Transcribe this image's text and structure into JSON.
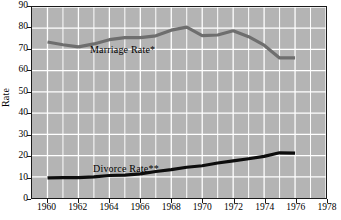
{
  "chart_data": {
    "type": "line",
    "title": "",
    "xlabel": "",
    "ylabel": "Rate",
    "xlim": [
      1959,
      1978
    ],
    "ylim": [
      0,
      90
    ],
    "yticks": [
      0,
      10,
      20,
      30,
      40,
      50,
      60,
      70,
      80,
      90
    ],
    "xticks": [
      1960,
      1962,
      1964,
      1966,
      1968,
      1970,
      1972,
      1974,
      1976,
      1978
    ],
    "grid": true,
    "grid_color": "#ffffff",
    "plot_background": "#b4b4b4",
    "legend_position": "inline-annotation",
    "series": [
      {
        "name": "Marriage Rate*",
        "color": "#6e6e6e",
        "x": [
          1960,
          1961,
          1962,
          1963,
          1964,
          1965,
          1966,
          1967,
          1968,
          1969,
          1970,
          1971,
          1972,
          1973,
          1974,
          1975,
          1976
        ],
        "values": [
          73.5,
          72.2,
          71.2,
          72.6,
          74.6,
          75.6,
          75.6,
          76.4,
          79.1,
          80.5,
          76.5,
          76.8,
          78.8,
          76.0,
          72.0,
          66.0,
          66.0
        ]
      },
      {
        "name": "Divorce Rate**",
        "color": "#0d0d0d",
        "x": [
          1960,
          1961,
          1962,
          1963,
          1964,
          1965,
          1966,
          1967,
          1968,
          1969,
          1970,
          1971,
          1972,
          1973,
          1974,
          1975,
          1976
        ],
        "values": [
          9.5,
          9.6,
          9.6,
          10.0,
          10.6,
          10.8,
          11.4,
          12.5,
          13.4,
          14.5,
          15.2,
          16.5,
          17.5,
          18.5,
          19.6,
          21.3,
          21.1
        ]
      }
    ],
    "annotations": [
      {
        "text": "Marriage Rate*",
        "x_px": 90,
        "y_px": 44
      },
      {
        "text": "Divorce Rate**",
        "x_px": 93,
        "y_px": 163
      }
    ]
  },
  "axes": {
    "y_title": "Rate",
    "y_tick_labels": [
      "90",
      "80",
      "70",
      "60",
      "50",
      "40",
      "30",
      "20",
      "10",
      "0"
    ],
    "x_tick_labels": [
      "1960",
      "1962",
      "1964",
      "1966",
      "1968",
      "1970",
      "1972",
      "1974",
      "1976",
      "1978"
    ]
  }
}
